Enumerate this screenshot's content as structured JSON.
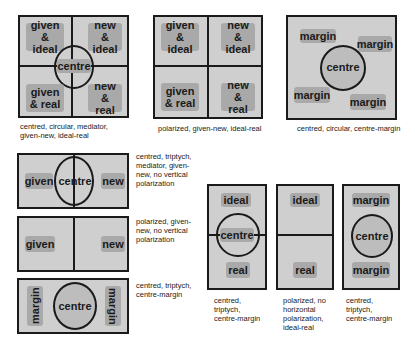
{
  "diagrams": [
    {
      "id": "d1",
      "labels": [
        "given & ideal",
        "new & ideal",
        "centre",
        "given & real",
        "new & real"
      ],
      "caption": "centred, circular, mediator, given-new, ideal-real"
    },
    {
      "id": "d2",
      "labels": [
        "given & ideal",
        "new & ideal",
        "given & real",
        "new & real"
      ],
      "caption": "polarized, given-new, ideal-real"
    },
    {
      "id": "d3",
      "labels": [
        "margin",
        "margin",
        "centre",
        "margin",
        "margin"
      ],
      "caption": "centred, circular, centre-margin"
    },
    {
      "id": "d4",
      "labels": [
        "given",
        "centre",
        "new"
      ],
      "caption": "centred, triptych, mediator, given-new, no vertical polarization"
    },
    {
      "id": "d5",
      "labels": [
        "given",
        "new"
      ],
      "caption": "polarized, given-new, no vertical polarization"
    },
    {
      "id": "d6",
      "labels": [
        "margin",
        "centre",
        "margin"
      ],
      "caption": "centred, triptych, centre-margin"
    },
    {
      "id": "d7",
      "labels": [
        "ideal",
        "centre",
        "real"
      ],
      "caption": "centred, triptych, centre-margin"
    },
    {
      "id": "d8",
      "labels": [
        "ideal",
        "real"
      ],
      "caption": "polarized, no horizontal polarization, ideal-real"
    },
    {
      "id": "d9",
      "labels": [
        "margin",
        "centre",
        "margin"
      ],
      "caption": "centred, triptych, centre-margin"
    }
  ],
  "colors": {
    "panel": "#cfcfcf",
    "label_box": "#a9a9a9",
    "line": "#1a1a1a"
  }
}
